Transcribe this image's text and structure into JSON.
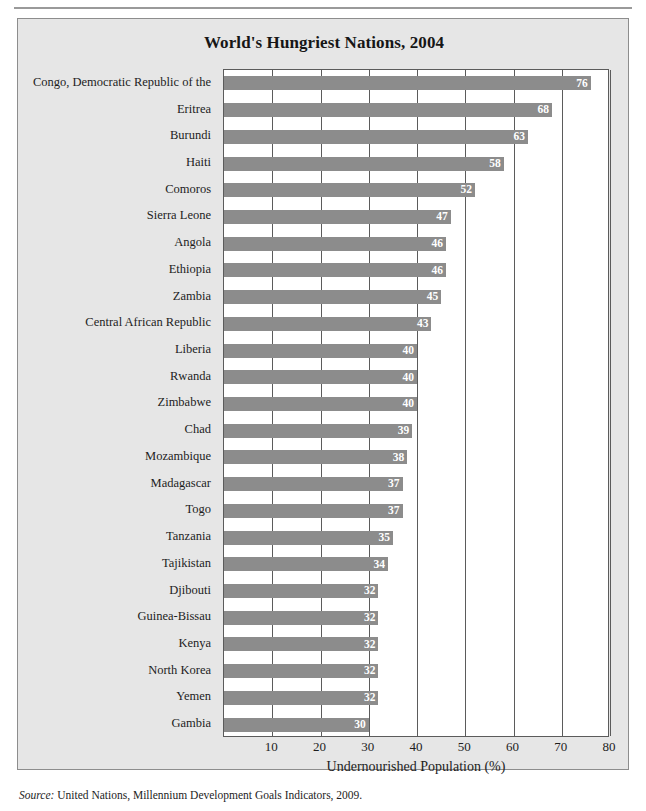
{
  "chart_data": {
    "type": "bar",
    "orientation": "horizontal",
    "title": "World's Hungriest Nations, 2004",
    "xlabel": "Undernourished Population (%)",
    "ylabel": "",
    "xlim": [
      0,
      80
    ],
    "xticks": [
      10,
      20,
      30,
      40,
      50,
      60,
      70,
      80
    ],
    "grid": true,
    "legend": null,
    "bar_color": "#8c8c8c",
    "value_label_color": "#ffffff",
    "categories": [
      "Congo, Democratic Republic of the",
      "Eritrea",
      "Burundi",
      "Haiti",
      "Comoros",
      "Sierra Leone",
      "Angola",
      "Ethiopia",
      "Zambia",
      "Central African Republic",
      "Liberia",
      "Rwanda",
      "Zimbabwe",
      "Chad",
      "Mozambique",
      "Madagascar",
      "Togo",
      "Tanzania",
      "Tajikistan",
      "Djibouti",
      "Guinea-Bissau",
      "Kenya",
      "North Korea",
      "Yemen",
      "Gambia"
    ],
    "values": [
      76,
      68,
      63,
      58,
      52,
      47,
      46,
      46,
      45,
      43,
      40,
      40,
      40,
      39,
      38,
      37,
      37,
      35,
      34,
      32,
      32,
      32,
      32,
      32,
      30
    ]
  },
  "source": {
    "prefix": "Source:",
    "text": " United Nations, Millennium Development Goals Indicators, 2009."
  }
}
